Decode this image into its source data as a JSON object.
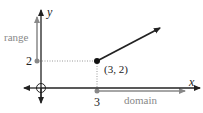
{
  "diagram": {
    "axes": {
      "x_label": "x",
      "y_label": "y"
    },
    "labels": {
      "range": "range",
      "domain": "domain",
      "y_tick": "2",
      "x_tick": "3",
      "point": "(3, 2)"
    },
    "colors": {
      "axis": "#222222",
      "annotation": "#888888",
      "ray": "#222222"
    }
  }
}
